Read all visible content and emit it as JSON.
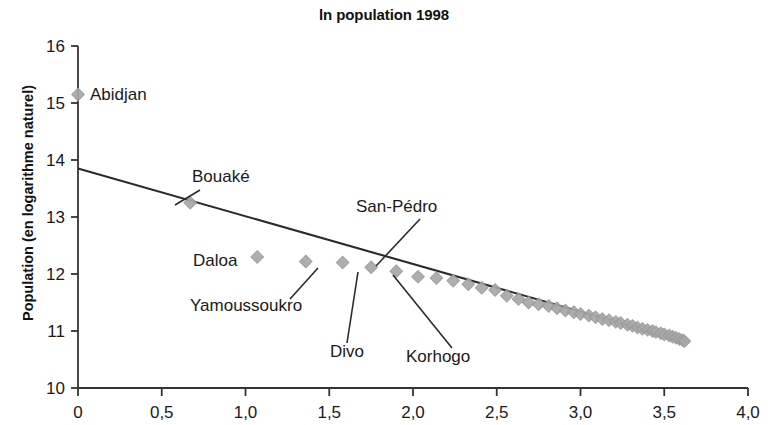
{
  "chart_data": {
    "type": "scatter",
    "title": "ln population 1998",
    "xlabel": "",
    "ylabel": "Population (en logarithme naturel)",
    "xlim": [
      0,
      4.0
    ],
    "ylim": [
      10,
      16
    ],
    "grid": false,
    "legend": null,
    "x_tick_labels": [
      "0",
      "0,5",
      "1,0",
      "1,5",
      "2,0",
      "2,5",
      "3,0",
      "3,5",
      "4,0"
    ],
    "x_tick_values": [
      0,
      0.5,
      1.0,
      1.5,
      2.0,
      2.5,
      3.0,
      3.5,
      4.0
    ],
    "y_tick_labels": [
      "10",
      "11",
      "12",
      "13",
      "14",
      "15",
      "16"
    ],
    "y_tick_values": [
      10,
      11,
      12,
      13,
      14,
      15,
      16
    ],
    "marker": "diamond",
    "marker_color": "#a8a8a8",
    "trendline": {
      "label": "fitted rank-size line",
      "color": "#2b2b2b",
      "x": [
        0.0,
        3.62
      ],
      "y": [
        13.85,
        10.82
      ]
    },
    "annotations": [
      {
        "label": "Abidjan",
        "x": 0.0,
        "y": 15.15,
        "leader": false
      },
      {
        "label": "Bouaké",
        "x": 0.67,
        "y": 13.25,
        "leader": true
      },
      {
        "label": "Daloa",
        "x": 1.07,
        "y": 12.3,
        "leader": false
      },
      {
        "label": "Yamoussoukro",
        "x": 1.36,
        "y": 12.22,
        "leader": true
      },
      {
        "label": "San-Pédro",
        "x": 1.75,
        "y": 12.12,
        "leader": true
      },
      {
        "label": "Divo",
        "x": 1.58,
        "y": 12.2,
        "leader": true
      },
      {
        "label": "Korhogo",
        "x": 1.9,
        "y": 12.05,
        "leader": true
      }
    ],
    "points": [
      {
        "x": 0.0,
        "y": 15.15
      },
      {
        "x": 0.67,
        "y": 13.25
      },
      {
        "x": 1.07,
        "y": 12.3
      },
      {
        "x": 1.36,
        "y": 12.22
      },
      {
        "x": 1.58,
        "y": 12.2
      },
      {
        "x": 1.75,
        "y": 12.12
      },
      {
        "x": 1.9,
        "y": 12.05
      },
      {
        "x": 2.03,
        "y": 11.95
      },
      {
        "x": 2.14,
        "y": 11.93
      },
      {
        "x": 2.24,
        "y": 11.88
      },
      {
        "x": 2.33,
        "y": 11.82
      },
      {
        "x": 2.41,
        "y": 11.76
      },
      {
        "x": 2.49,
        "y": 11.72
      },
      {
        "x": 2.56,
        "y": 11.62
      },
      {
        "x": 2.63,
        "y": 11.56
      },
      {
        "x": 2.69,
        "y": 11.5
      },
      {
        "x": 2.75,
        "y": 11.47
      },
      {
        "x": 2.81,
        "y": 11.44
      },
      {
        "x": 2.86,
        "y": 11.4
      },
      {
        "x": 2.91,
        "y": 11.36
      },
      {
        "x": 2.96,
        "y": 11.33
      },
      {
        "x": 3.0,
        "y": 11.3
      },
      {
        "x": 3.05,
        "y": 11.27
      },
      {
        "x": 3.09,
        "y": 11.24
      },
      {
        "x": 3.13,
        "y": 11.21
      },
      {
        "x": 3.17,
        "y": 11.19
      },
      {
        "x": 3.21,
        "y": 11.16
      },
      {
        "x": 3.24,
        "y": 11.14
      },
      {
        "x": 3.28,
        "y": 11.11
      },
      {
        "x": 3.31,
        "y": 11.09
      },
      {
        "x": 3.34,
        "y": 11.06
      },
      {
        "x": 3.37,
        "y": 11.04
      },
      {
        "x": 3.4,
        "y": 11.02
      },
      {
        "x": 3.43,
        "y": 11.0
      },
      {
        "x": 3.45,
        "y": 10.98
      },
      {
        "x": 3.48,
        "y": 10.96
      },
      {
        "x": 3.5,
        "y": 10.94
      },
      {
        "x": 3.53,
        "y": 10.92
      },
      {
        "x": 3.55,
        "y": 10.9
      },
      {
        "x": 3.57,
        "y": 10.88
      },
      {
        "x": 3.59,
        "y": 10.86
      },
      {
        "x": 3.61,
        "y": 10.84
      },
      {
        "x": 3.62,
        "y": 10.82
      }
    ]
  }
}
